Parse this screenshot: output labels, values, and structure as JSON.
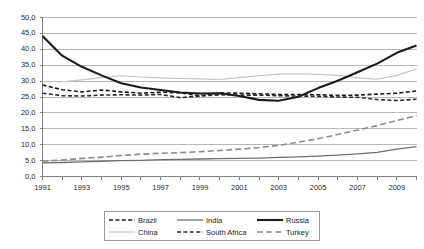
{
  "chart_data": {
    "type": "line",
    "title": "",
    "subtitle": "",
    "xlabel": "",
    "ylabel": "",
    "xlim": [
      1991,
      2010
    ],
    "ylim": [
      0.0,
      50.0
    ],
    "grid": true,
    "legend_position": "bottom",
    "x": [
      1991,
      1992,
      1993,
      1994,
      1995,
      1996,
      1997,
      1998,
      1999,
      2000,
      2001,
      2002,
      2003,
      2004,
      2005,
      2006,
      2007,
      2008,
      2009,
      2010
    ],
    "x_tick_labels": [
      "1991",
      "1993",
      "1995",
      "1997",
      "1999",
      "2001",
      "2003",
      "2005",
      "2007",
      "2009"
    ],
    "y_tick_labels": [
      "0,0",
      "5,0",
      "10,0",
      "15,0",
      "20,0",
      "25,0",
      "30,0",
      "35,0",
      "40,0",
      "45,0",
      "50,0"
    ],
    "y_ticks": [
      0.0,
      5.0,
      10.0,
      15.0,
      20.0,
      25.0,
      30.0,
      35.0,
      40.0,
      45.0,
      50.0
    ],
    "series": [
      {
        "name": "Brazil",
        "color": "#1a1a1a",
        "style": "dashed",
        "width": 1.6,
        "dash": "4,2.4",
        "values": [
          28.8,
          27.3,
          26.6,
          27.2,
          26.6,
          26.2,
          26.5,
          26.3,
          25.4,
          26.3,
          26.2,
          26.0,
          25.8,
          25.8,
          25.7,
          25.5,
          25.6,
          25.9,
          26.2,
          26.9
        ]
      },
      {
        "name": "China",
        "color": "#c2c2c2",
        "style": "solid",
        "width": 1.1,
        "dash": "",
        "values": [
          29.8,
          29.8,
          30.4,
          31.1,
          31.7,
          31.3,
          31.0,
          30.8,
          30.7,
          30.5,
          31.1,
          31.7,
          32.2,
          32.3,
          32.1,
          31.8,
          31.0,
          30.6,
          31.8,
          33.8
        ]
      },
      {
        "name": "India",
        "color": "#6f6f6f",
        "style": "solid",
        "width": 1.3,
        "dash": "",
        "values": [
          4.3,
          4.4,
          4.6,
          4.8,
          5.0,
          5.1,
          5.3,
          5.4,
          5.5,
          5.6,
          5.7,
          5.8,
          6.0,
          6.2,
          6.4,
          6.7,
          7.1,
          7.6,
          8.6,
          9.4
        ]
      },
      {
        "name": "Russia",
        "color": "#1a1a1a",
        "style": "solid",
        "width": 2.1,
        "dash": "",
        "values": [
          44.2,
          38.0,
          34.5,
          31.8,
          29.3,
          28.0,
          27.2,
          26.4,
          26.1,
          26.2,
          25.3,
          24.1,
          23.8,
          25.1,
          27.8,
          30.1,
          32.8,
          35.5,
          38.9,
          41.2
        ]
      },
      {
        "name": "South Africa",
        "color": "#2b2b2b",
        "style": "dashed",
        "width": 1.6,
        "dash": "4,2.4",
        "values": [
          26.2,
          25.4,
          25.3,
          25.6,
          25.7,
          25.6,
          25.8,
          24.8,
          25.3,
          25.7,
          25.6,
          25.6,
          25.4,
          25.3,
          25.2,
          25.0,
          24.9,
          24.2,
          23.9,
          24.3
        ]
      },
      {
        "name": "Turkey",
        "color": "#8c8c8c",
        "style": "longdash",
        "width": 1.6,
        "dash": "6,3.2",
        "values": [
          4.8,
          5.2,
          5.7,
          6.1,
          6.6,
          7.0,
          7.3,
          7.5,
          7.8,
          8.2,
          8.6,
          9.1,
          9.8,
          10.8,
          11.9,
          13.2,
          14.6,
          16.0,
          17.6,
          19.2
        ]
      }
    ]
  },
  "legend": {
    "entries": [
      {
        "label": "Brazil"
      },
      {
        "label": "India"
      },
      {
        "label": "Russia"
      },
      {
        "label": "China"
      },
      {
        "label": "South Africa"
      },
      {
        "label": "Turkey"
      }
    ]
  },
  "axes": {
    "grid_color": "#b8b8b8",
    "axis_color": "#808080"
  }
}
